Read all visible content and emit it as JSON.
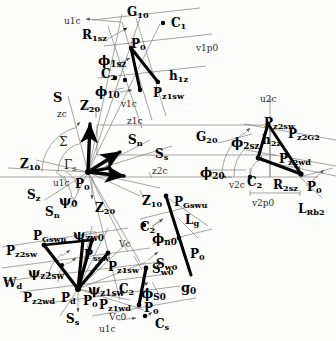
{
  "figure": {
    "type": "technical-vector-diagram",
    "width": 336,
    "height": 341,
    "colors": {
      "background": "#fdfdfb",
      "stroke_heavy": "#000000",
      "stroke_thin": "#6b6b6b",
      "text": "#000000"
    }
  },
  "labels": {
    "top_cluster": [
      {
        "id": "u1c",
        "text": "u1c",
        "x": 64,
        "y": 17,
        "style": "thin",
        "size": 9
      },
      {
        "id": "G10",
        "text": "G",
        "sub": "10",
        "x": 127,
        "y": 6,
        "style": "bold",
        "size": 12
      },
      {
        "id": "C1",
        "text": "C",
        "sub": "1",
        "x": 171,
        "y": 17,
        "style": "bold",
        "size": 12
      },
      {
        "id": "R1sz",
        "text": "R",
        "sub": "1sz",
        "x": 82,
        "y": 29,
        "style": "bold",
        "size": 12
      },
      {
        "id": "P0_top",
        "text": "P",
        "sub": "0",
        "x": 131,
        "y": 38,
        "style": "bold",
        "size": 12
      },
      {
        "id": "v1p0",
        "text": "v1p0",
        "x": 196,
        "y": 44,
        "style": "thin",
        "size": 9
      },
      {
        "id": "phi1sz",
        "text": "ϕ",
        "sub": "1sz",
        "x": 98,
        "y": 54,
        "style": "bold",
        "size": 13
      },
      {
        "id": "C2_top",
        "text": "C",
        "sub": "2",
        "x": 101,
        "y": 68,
        "style": "bold",
        "size": 12
      },
      {
        "id": "h1z",
        "text": "h",
        "sub": "1z",
        "x": 169,
        "y": 70,
        "style": "bold",
        "size": 12
      },
      {
        "id": "phi10",
        "text": "ϕ",
        "sub": "10",
        "x": 95,
        "y": 85,
        "style": "bold",
        "size": 13
      },
      {
        "id": "Pz1sw",
        "text": "P",
        "sub": "z1sw",
        "x": 153,
        "y": 87,
        "style": "bold",
        "size": 12
      },
      {
        "id": "v1c",
        "text": "v1c",
        "x": 121,
        "y": 100,
        "style": "thin",
        "size": 9
      },
      {
        "id": "z1c",
        "text": "z1c",
        "x": 127,
        "y": 117,
        "style": "thin",
        "size": 9
      }
    ],
    "center_cluster": [
      {
        "id": "S_s_upper",
        "text": "S",
        "sub": "",
        "x": 53,
        "y": 91,
        "style": "bold",
        "size": 13
      },
      {
        "id": "Z20_up",
        "text": "Z",
        "sub": "20",
        "x": 80,
        "y": 100,
        "style": "bold",
        "size": 12
      },
      {
        "id": "zc",
        "text": "zc",
        "x": 57,
        "y": 110,
        "style": "thin",
        "size": 9
      },
      {
        "id": "Sigma",
        "text": "Σ",
        "x": 59,
        "y": 136,
        "style": "thin",
        "size": 12
      },
      {
        "id": "Sn_1",
        "text": "S",
        "sub": "n",
        "x": 128,
        "y": 134,
        "style": "bold",
        "size": 12
      },
      {
        "id": "Ss_1",
        "text": "S",
        "sub": "s",
        "x": 155,
        "y": 148,
        "style": "bold",
        "size": 12
      },
      {
        "id": "GammaS",
        "text": "Γ",
        "sub": "s",
        "x": 64,
        "y": 159,
        "style": "thin",
        "size": 12
      },
      {
        "id": "Z10",
        "text": "Z",
        "sub": "10",
        "x": 20,
        "y": 158,
        "style": "bold",
        "size": 12
      },
      {
        "id": "z2c",
        "text": "z2c",
        "x": 152,
        "y": 167,
        "style": "thin",
        "size": 9
      },
      {
        "id": "u1c_c",
        "text": "u1c",
        "x": 53,
        "y": 179,
        "style": "thin",
        "size": 9
      },
      {
        "id": "P0_ctr",
        "text": "P",
        "sub": "0",
        "x": 75,
        "y": 178,
        "style": "bold",
        "size": 12
      },
      {
        "id": "Sz",
        "text": "S",
        "sub": "z",
        "x": 27,
        "y": 189,
        "style": "bold",
        "size": 12
      },
      {
        "id": "psi0",
        "text": "ψ",
        "sub": "0",
        "x": 59,
        "y": 194,
        "style": "bold",
        "size": 13
      },
      {
        "id": "Z10b",
        "text": "Z",
        "sub": "10",
        "x": 142,
        "y": 195,
        "style": "bold",
        "size": 12
      },
      {
        "id": "Sn_2",
        "text": "S",
        "sub": "n",
        "x": 45,
        "y": 206,
        "style": "bold",
        "size": 12
      },
      {
        "id": "Z20_dn",
        "text": "Z",
        "sub": "20",
        "x": 95,
        "y": 202,
        "style": "bold",
        "size": 12
      }
    ],
    "right_cluster": [
      {
        "id": "u2c",
        "text": "u2c",
        "x": 260,
        "y": 95,
        "style": "thin",
        "size": 9
      },
      {
        "id": "Pz2sw",
        "text": "P",
        "sub": "z2sw",
        "x": 264,
        "y": 117,
        "style": "bold",
        "size": 12
      },
      {
        "id": "G20",
        "text": "G",
        "sub": "20",
        "x": 196,
        "y": 131,
        "style": "bold",
        "size": 12
      },
      {
        "id": "phi2sz",
        "text": "ϕ",
        "sub": "2sz",
        "x": 231,
        "y": 136,
        "style": "bold",
        "size": 13
      },
      {
        "id": "h2z",
        "text": "h",
        "sub": "2z",
        "x": 262,
        "y": 134,
        "style": "bold",
        "size": 12
      },
      {
        "id": "Pz2G2",
        "text": "P",
        "sub": "z2G2",
        "x": 288,
        "y": 128,
        "style": "bold",
        "size": 12
      },
      {
        "id": "Pz2wd",
        "text": "P",
        "sub": "z2wd",
        "x": 279,
        "y": 153,
        "style": "bold",
        "size": 12
      },
      {
        "id": "phi20",
        "text": "ϕ",
        "sub": "20",
        "x": 200,
        "y": 166,
        "style": "bold",
        "size": 13
      },
      {
        "id": "v2c",
        "text": "v2c",
        "x": 229,
        "y": 181,
        "style": "thin",
        "size": 9
      },
      {
        "id": "C2_rt",
        "text": "C",
        "sub": "2",
        "x": 247,
        "y": 176,
        "style": "bold",
        "size": 12
      },
      {
        "id": "R2sz",
        "text": "R",
        "sub": "2sz",
        "x": 273,
        "y": 179,
        "style": "bold",
        "size": 12
      },
      {
        "id": "P0_rt",
        "text": "P",
        "sub": "0",
        "x": 307,
        "y": 181,
        "style": "bold",
        "size": 12
      },
      {
        "id": "v2p0",
        "text": "v2p0",
        "x": 252,
        "y": 199,
        "style": "thin",
        "size": 9
      },
      {
        "id": "LRb2",
        "text": "L",
        "sub": "Rb2",
        "x": 298,
        "y": 203,
        "style": "bold",
        "size": 12
      }
    ],
    "bottom_right_cluster": [
      {
        "id": "PGswu",
        "text": "P",
        "sub": "Gswu",
        "x": 174,
        "y": 196,
        "style": "bold",
        "size": 12
      },
      {
        "id": "Lg",
        "text": "L",
        "sub": "g",
        "x": 185,
        "y": 214,
        "style": "bold",
        "size": 12
      },
      {
        "id": "C2_brc",
        "text": "C",
        "sub": "2",
        "x": 140,
        "y": 221,
        "style": "bold",
        "size": 12
      },
      {
        "id": "phin0",
        "text": "ϕ",
        "sub": "n0",
        "x": 152,
        "y": 232,
        "style": "bold",
        "size": 13
      },
      {
        "id": "P0_brc",
        "text": "P",
        "sub": "0",
        "x": 190,
        "y": 248,
        "style": "bold",
        "size": 12
      },
      {
        "id": "Sw0",
        "text": "S",
        "sub": "w0",
        "x": 156,
        "y": 258,
        "style": "bold",
        "size": 12
      },
      {
        "id": "g0",
        "text": "g",
        "sub": "0",
        "x": 181,
        "y": 281,
        "style": "bold",
        "size": 13
      }
    ],
    "bottom_left_cluster": [
      {
        "id": "PGswn",
        "text": "P",
        "sub": "Gswn",
        "x": 33,
        "y": 230,
        "style": "bold",
        "size": 12
      },
      {
        "id": "psizw0",
        "text": "ψ",
        "sub": "zw0",
        "x": 73,
        "y": 228,
        "style": "bold",
        "size": 13
      },
      {
        "id": "vc",
        "text": "Vc",
        "x": 119,
        "y": 240,
        "style": "thin",
        "size": 9
      },
      {
        "id": "Pz2sw_b",
        "text": "P",
        "sub": "z2sw",
        "x": 6,
        "y": 245,
        "style": "bold",
        "size": 12
      },
      {
        "id": "Pssw",
        "text": "P",
        "sub": "ssw",
        "x": 84,
        "y": 249,
        "style": "bold",
        "size": 12
      },
      {
        "id": "Pz1sw_b",
        "text": "P",
        "sub": "z1sw",
        "x": 108,
        "y": 261,
        "style": "bold",
        "size": 12
      },
      {
        "id": "psiz2sw",
        "text": "ψ",
        "sub": "z2sw",
        "x": 28,
        "y": 266,
        "style": "bold",
        "size": 13
      },
      {
        "id": "Sw0_b",
        "text": "S",
        "sub": "w0",
        "x": 152,
        "y": 263,
        "style": "bold",
        "size": 12
      },
      {
        "id": "Wd",
        "text": "W",
        "sub": "d",
        "x": 3,
        "y": 277,
        "style": "bold",
        "size": 12
      },
      {
        "id": "psiz1sw",
        "text": "ψ",
        "sub": "z1sw",
        "x": 88,
        "y": 283,
        "style": "bold",
        "size": 13
      },
      {
        "id": "C2_bl",
        "text": "C",
        "sub": "2",
        "x": 119,
        "y": 283,
        "style": "bold",
        "size": 12
      },
      {
        "id": "phiS0",
        "text": "ϕ",
        "sub": "S0",
        "x": 141,
        "y": 287,
        "style": "bold",
        "size": 13
      },
      {
        "id": "Pz2wd",
        "text": "P",
        "sub": "z2wd",
        "x": 23,
        "y": 292,
        "style": "bold",
        "size": 12
      },
      {
        "id": "Pd",
        "text": "P",
        "sub": "d",
        "x": 61,
        "y": 292,
        "style": "bold",
        "size": 12
      },
      {
        "id": "P0_bl",
        "text": "P",
        "sub": "0",
        "x": 83,
        "y": 295,
        "style": "bold",
        "size": 12
      },
      {
        "id": "Pz1wd",
        "text": "P",
        "sub": "z1wd",
        "x": 99,
        "y": 299,
        "style": "bold",
        "size": 12
      },
      {
        "id": "P0_bl2",
        "text": "P",
        "sub": "0",
        "x": 144,
        "y": 302,
        "style": "bold",
        "size": 12
      },
      {
        "id": "Ss_bl",
        "text": "S",
        "sub": "s",
        "x": 66,
        "y": 313,
        "style": "bold",
        "size": 12
      },
      {
        "id": "vc0",
        "text": "Vc0",
        "x": 109,
        "y": 313,
        "style": "thin",
        "size": 9
      },
      {
        "id": "Cs",
        "text": "C",
        "sub": "s",
        "x": 155,
        "y": 318,
        "style": "bold",
        "size": 12
      },
      {
        "id": "u1c_bl",
        "text": "u1c",
        "x": 99,
        "y": 325,
        "style": "thin",
        "size": 9
      }
    ]
  },
  "geometry": {
    "origins": {
      "P0_center": [
        87,
        172
      ],
      "P0_right": [
        301,
        174
      ],
      "P0_bottom_left": [
        78,
        289
      ],
      "P0_top": [
        131,
        48
      ]
    },
    "notes": "Black heavy vector arrows with thin gray construction/projection lines."
  }
}
